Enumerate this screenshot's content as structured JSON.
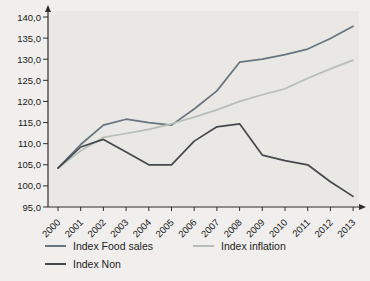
{
  "chart_data": {
    "type": "line",
    "title": "",
    "xlabel": "",
    "ylabel": "",
    "categories": [
      "2000",
      "2001",
      "2002",
      "2003",
      "2004",
      "2005",
      "2006",
      "2007",
      "2008",
      "2009",
      "2010",
      "2011",
      "2012",
      "2013"
    ],
    "series": [
      {
        "name": "Index Food sales",
        "color": "#68747f",
        "values": [
          104.2,
          109.8,
          114.4,
          115.8,
          115.0,
          114.4,
          118.2,
          122.5,
          129.3,
          130.0,
          131.1,
          132.4,
          134.9,
          137.8
        ]
      },
      {
        "name": "Index inflation",
        "color": "#b7beb8",
        "values": [
          104.2,
          108.3,
          111.5,
          112.4,
          113.4,
          114.7,
          116.3,
          118.0,
          120.0,
          121.6,
          123.0,
          125.5,
          127.7,
          129.8
        ]
      },
      {
        "name": "Index Non",
        "color": "#45494d",
        "values": [
          104.2,
          109.2,
          111.0,
          108.0,
          105.0,
          105.0,
          110.6,
          114.0,
          114.7,
          107.3,
          106.0,
          105.0,
          101.0,
          97.5
        ]
      }
    ],
    "ylim": [
      95,
      140
    ],
    "ytick_step": 5,
    "ytick_labels": [
      "95,0",
      "100,0",
      "105,0",
      "110,0",
      "115,0",
      "120,0",
      "125,0",
      "130,0",
      "135,0",
      "140,0"
    ],
    "grid": false,
    "legend_position": "bottom",
    "plot_bg": "#e9e8e5",
    "axis_color": "#2e2e2e",
    "tick_label_color": "#1a1a1a"
  }
}
